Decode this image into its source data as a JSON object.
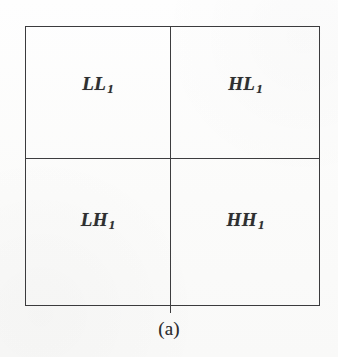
{
  "figure": {
    "caption": "(a)",
    "line_color": "#3b3b3d",
    "text_color": "#2e2e30",
    "background_color": "#fdfdfc",
    "quadrants": [
      {
        "position": "top-left",
        "base": "LL",
        "level": "1",
        "name": "LL1"
      },
      {
        "position": "top-right",
        "base": "HL",
        "level": "1",
        "name": "HL1"
      },
      {
        "position": "bottom-left",
        "base": "LH",
        "level": "1",
        "name": "LH1"
      },
      {
        "position": "bottom-right",
        "base": "HH",
        "level": "1",
        "name": "HH1"
      }
    ]
  }
}
